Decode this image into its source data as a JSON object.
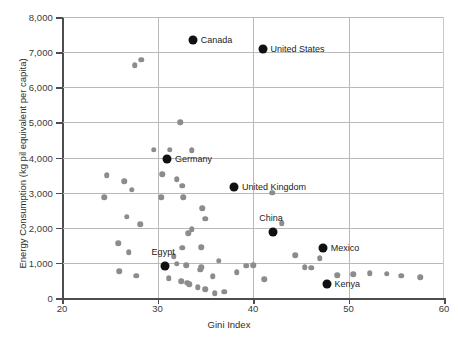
{
  "chart_data": {
    "type": "scatter",
    "title": "",
    "xlabel": "Gini Index",
    "ylabel": "Energy Consumption (kg pil equivalent per capita)",
    "xlim": [
      20,
      60
    ],
    "ylim": [
      0,
      8000
    ],
    "xticks": [
      "20",
      "30",
      "40",
      "50",
      "60"
    ],
    "xtick_values": [
      20,
      30,
      40,
      50,
      60
    ],
    "yticks": [
      "0",
      "1,000",
      "2,000",
      "3,000",
      "4,000",
      "5,000",
      "6,000",
      "7,000",
      "8,000"
    ],
    "ytick_values": [
      0,
      1000,
      2000,
      3000,
      4000,
      5000,
      6000,
      7000,
      8000
    ],
    "grid": true,
    "legend": "none",
    "colors": {
      "highlight_point": "#111111",
      "normal_point": "#8c8c8c",
      "gridline": "#b9b9b9",
      "axis": "#4d4d4d",
      "text": "#2d2d2d",
      "background": "#ffffff"
    },
    "highlighted": [
      {
        "label": "Canada",
        "x": 33.7,
        "y": 7350,
        "label_side": "right"
      },
      {
        "label": "United States",
        "x": 41.0,
        "y": 7100,
        "label_side": "right"
      },
      {
        "label": "Germany",
        "x": 31.0,
        "y": 3970,
        "label_side": "right"
      },
      {
        "label": "United Kingdom",
        "x": 38.0,
        "y": 3150,
        "label_side": "right"
      },
      {
        "label": "China",
        "x": 42.1,
        "y": 1870,
        "label_side": "above"
      },
      {
        "label": "Mexico",
        "x": 47.3,
        "y": 1430,
        "label_side": "right"
      },
      {
        "label": "Egypt",
        "x": 30.8,
        "y": 900,
        "label_side": "above"
      },
      {
        "label": "Kenya",
        "x": 47.7,
        "y": 400,
        "label_side": "right"
      }
    ],
    "points": [
      {
        "x": 24.7,
        "y": 3500
      },
      {
        "x": 24.4,
        "y": 2870
      },
      {
        "x": 27.6,
        "y": 6620
      },
      {
        "x": 28.3,
        "y": 6790
      },
      {
        "x": 26.5,
        "y": 3320
      },
      {
        "x": 27.3,
        "y": 3080
      },
      {
        "x": 26.8,
        "y": 2310
      },
      {
        "x": 28.2,
        "y": 2100
      },
      {
        "x": 25.9,
        "y": 1560
      },
      {
        "x": 27.0,
        "y": 1300
      },
      {
        "x": 26.0,
        "y": 760
      },
      {
        "x": 27.8,
        "y": 640
      },
      {
        "x": 29.6,
        "y": 4220
      },
      {
        "x": 31.3,
        "y": 4220
      },
      {
        "x": 33.6,
        "y": 4210
      },
      {
        "x": 32.4,
        "y": 5000
      },
      {
        "x": 30.5,
        "y": 3520
      },
      {
        "x": 32.0,
        "y": 3380
      },
      {
        "x": 32.6,
        "y": 3200
      },
      {
        "x": 30.4,
        "y": 2870
      },
      {
        "x": 32.7,
        "y": 2870
      },
      {
        "x": 34.7,
        "y": 2560
      },
      {
        "x": 35.0,
        "y": 2250
      },
      {
        "x": 33.6,
        "y": 1960
      },
      {
        "x": 33.2,
        "y": 1840
      },
      {
        "x": 34.6,
        "y": 1440
      },
      {
        "x": 32.6,
        "y": 1430
      },
      {
        "x": 31.7,
        "y": 1190
      },
      {
        "x": 32.0,
        "y": 980
      },
      {
        "x": 33.0,
        "y": 930
      },
      {
        "x": 34.6,
        "y": 880
      },
      {
        "x": 34.5,
        "y": 810
      },
      {
        "x": 31.2,
        "y": 560
      },
      {
        "x": 32.5,
        "y": 470
      },
      {
        "x": 33.1,
        "y": 440
      },
      {
        "x": 33.3,
        "y": 390
      },
      {
        "x": 34.2,
        "y": 300
      },
      {
        "x": 35.0,
        "y": 250
      },
      {
        "x": 35.8,
        "y": 620
      },
      {
        "x": 36.4,
        "y": 1060
      },
      {
        "x": 38.3,
        "y": 740
      },
      {
        "x": 39.3,
        "y": 920
      },
      {
        "x": 40.0,
        "y": 930
      },
      {
        "x": 41.2,
        "y": 540
      },
      {
        "x": 42.0,
        "y": 3000
      },
      {
        "x": 43.0,
        "y": 2130
      },
      {
        "x": 44.4,
        "y": 1210
      },
      {
        "x": 45.4,
        "y": 880
      },
      {
        "x": 46.1,
        "y": 860
      },
      {
        "x": 47.0,
        "y": 1130
      },
      {
        "x": 48.8,
        "y": 650
      },
      {
        "x": 50.5,
        "y": 670
      },
      {
        "x": 52.2,
        "y": 700
      },
      {
        "x": 54.0,
        "y": 690
      },
      {
        "x": 55.5,
        "y": 640
      },
      {
        "x": 57.5,
        "y": 590
      },
      {
        "x": 36.0,
        "y": 130
      },
      {
        "x": 37.0,
        "y": 180
      }
    ]
  }
}
